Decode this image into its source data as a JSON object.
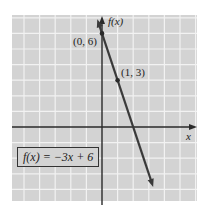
{
  "chart_data": {
    "type": "line",
    "title": "",
    "xlabel": "x",
    "ylabel": "f(x)",
    "function": "f(x) = -3x + 6",
    "slope": -3,
    "intercept": 6,
    "grid": true,
    "xlim": [
      -6,
      6
    ],
    "ylim": [
      -5,
      7
    ],
    "series": [
      {
        "name": "f(x) = -3x + 6",
        "x": [
          0,
          1,
          2,
          3.3
        ],
        "y": [
          6,
          3,
          0,
          -3.9
        ]
      }
    ],
    "labeled_points": [
      {
        "x": 0,
        "y": 6,
        "label": "(0, 6)"
      },
      {
        "x": 1,
        "y": 3,
        "label": "(1, 3)"
      }
    ],
    "annotations": [
      "f(x) = -3x + 6"
    ]
  },
  "labels": {
    "y_axis": "f(x)",
    "x_axis": "x",
    "point_a": "(0, 6)",
    "point_b": "(1, 3)",
    "equation": "f(x) = −3x + 6"
  },
  "colors": {
    "grid_bg": "#d3d3d3",
    "grid_line": "#f2f2f2",
    "axis": "#2a2a2a",
    "line": "#3a3a3a"
  }
}
